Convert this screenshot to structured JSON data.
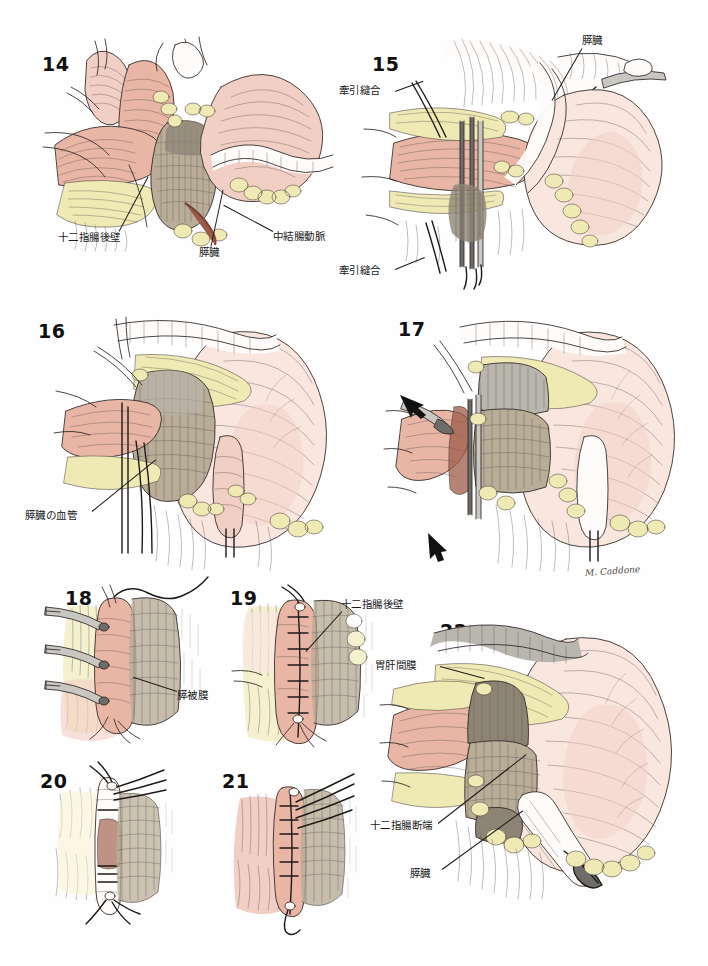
{
  "page": {
    "background_color": "#ffffff",
    "ink_color": "#2b2522",
    "accent_flesh": "#e9b6a6",
    "accent_fat": "#efe9b4",
    "accent_pancreas": "#b9ad98",
    "signature": "M. Caddone"
  },
  "figures": [
    {
      "number": "14",
      "labels": [
        {
          "text": "十二指腸後壁"
        },
        {
          "text": "膵臓"
        },
        {
          "text": "中結腸動脈"
        }
      ]
    },
    {
      "number": "15",
      "labels": [
        {
          "text": "膵臓"
        },
        {
          "text": "牽引縫合"
        },
        {
          "text": "牽引縫合"
        }
      ]
    },
    {
      "number": "16",
      "labels": [
        {
          "text": "膵臓の血管"
        }
      ]
    },
    {
      "number": "17",
      "labels": []
    },
    {
      "number": "18",
      "labels": [
        {
          "text": "膵被膜"
        }
      ]
    },
    {
      "number": "19",
      "labels": [
        {
          "text": "十二指腸後壁"
        }
      ]
    },
    {
      "number": "20",
      "labels": []
    },
    {
      "number": "21",
      "labels": []
    },
    {
      "number": "22",
      "labels": [
        {
          "text": "胃肝間膜"
        },
        {
          "text": "十二指腸断端"
        },
        {
          "text": "膵臓"
        }
      ]
    }
  ]
}
